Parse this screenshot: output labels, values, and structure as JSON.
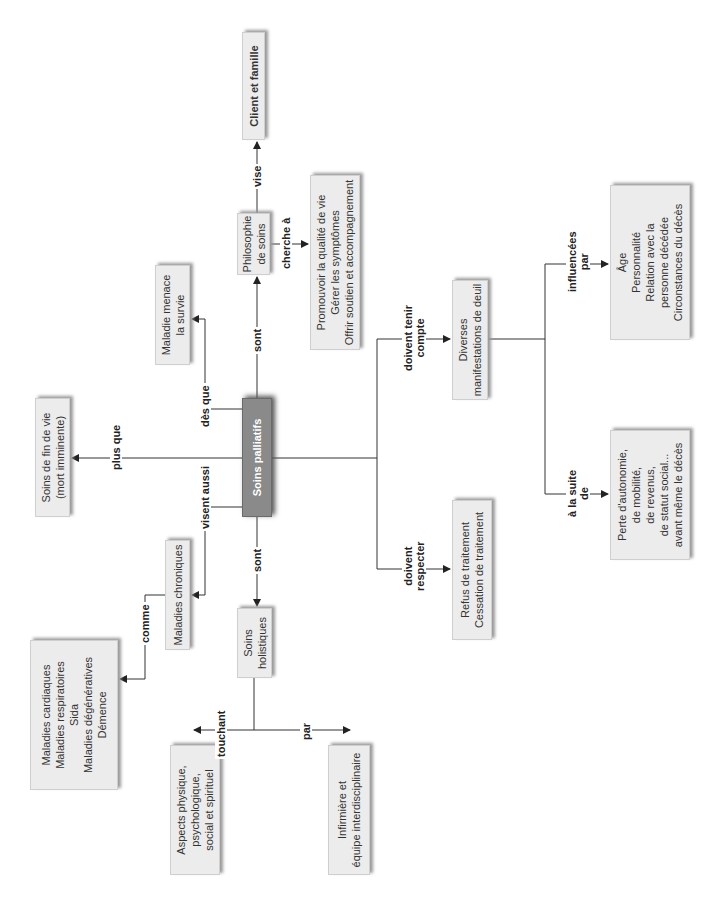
{
  "diagram": {
    "type": "concept-map",
    "orientation": "rotated-90-ccw",
    "central_node": "Soins palliatifs",
    "nodes": {
      "central": {
        "lines": [
          "Soins palliatifs"
        ]
      },
      "fin_de_vie": {
        "lines": [
          "Soins de fin de vie",
          "(mort imminente)"
        ]
      },
      "maladie_menace": {
        "lines": [
          "Maladie menace",
          "la survie"
        ]
      },
      "philosophie": {
        "lines": [
          "Philosophie",
          "de soins"
        ]
      },
      "client": {
        "lines": [
          "Client et famille"
        ]
      },
      "cherche": {
        "lines": [
          "Promouvoir la qualité de vie",
          "Gérer les symptômes",
          "Offrir soutien et accompagnement"
        ]
      },
      "chroniques": {
        "lines": [
          "Maladies chroniques"
        ]
      },
      "maladies_liste": {
        "lines": [
          "Maladies cardiaques",
          "Maladies respiratoires",
          "Sida",
          "Maladies dégénératives",
          "Démence"
        ]
      },
      "holistiques": {
        "lines": [
          "Soins",
          "holistiques"
        ]
      },
      "aspects": {
        "lines": [
          "Aspects physique,",
          "psychologique,",
          "social et spirituel"
        ]
      },
      "infirmiere": {
        "lines": [
          "Infirmière et",
          "équipe interdisciplinaire"
        ]
      },
      "refus": {
        "lines": [
          "Refus de traitement",
          "Cessation de traitement"
        ]
      },
      "deuil": {
        "lines": [
          "Diverses",
          "manifestations de deuil"
        ]
      },
      "perte": {
        "lines": [
          "Perte d'autonomie,",
          "de mobilité,",
          "de revenus,",
          "de statut social...",
          "avant même le décès"
        ]
      },
      "facteurs": {
        "lines": [
          "Âge",
          "Personnalité",
          "Relation avec la",
          "personne décédée",
          "Circonstances du décès"
        ]
      }
    },
    "links": {
      "plus_que": "plus que",
      "des_que": "dès que",
      "sont_philo": "sont",
      "vise": "vise",
      "cherche_a": "cherche à",
      "visent_aussi": "visent aussi",
      "comme": "comme",
      "sont_holist": "sont",
      "touchant": "touchant",
      "par": "par",
      "doivent_respecter": [
        "doivent",
        "respecter"
      ],
      "doivent_tenir": [
        "doivent tenir",
        "compte"
      ],
      "a_la_suite": [
        "à la suite",
        "de"
      ],
      "influencees": [
        "influencées",
        "par"
      ]
    },
    "edges": [
      {
        "from": "Soins palliatifs",
        "to": "Soins de fin de vie (mort imminente)",
        "label": "plus que"
      },
      {
        "from": "Soins palliatifs",
        "to": "Maladie menace la survie",
        "label": "dès que"
      },
      {
        "from": "Soins palliatifs",
        "to": "Philosophie de soins",
        "label": "sont"
      },
      {
        "from": "Philosophie de soins",
        "to": "Client et famille",
        "label": "vise"
      },
      {
        "from": "Philosophie de soins",
        "to": "Promouvoir la qualité de vie / Gérer les symptômes / Offrir soutien et accompagnement",
        "label": "cherche à"
      },
      {
        "from": "Soins palliatifs",
        "to": "Maladies chroniques",
        "label": "visent aussi"
      },
      {
        "from": "Maladies chroniques",
        "to": "Maladies cardiaques / respiratoires / Sida / dégénératives / Démence",
        "label": "comme"
      },
      {
        "from": "Soins palliatifs",
        "to": "Soins holistiques",
        "label": "sont"
      },
      {
        "from": "Soins holistiques",
        "to": "Aspects physique, psychologique, social et spirituel",
        "label": "touchant"
      },
      {
        "from": "Soins holistiques",
        "to": "Infirmière et équipe interdisciplinaire",
        "label": "par"
      },
      {
        "from": "Soins palliatifs",
        "to": "Refus de traitement / Cessation de traitement",
        "label": "doivent respecter"
      },
      {
        "from": "Soins palliatifs",
        "to": "Diverses manifestations de deuil",
        "label": "doivent tenir compte"
      },
      {
        "from": "Diverses manifestations de deuil",
        "to": "Perte d'autonomie...",
        "label": "à la suite de"
      },
      {
        "from": "Diverses manifestations de deuil",
        "to": "Âge / Personnalité / ...",
        "label": "influencées par"
      }
    ]
  }
}
